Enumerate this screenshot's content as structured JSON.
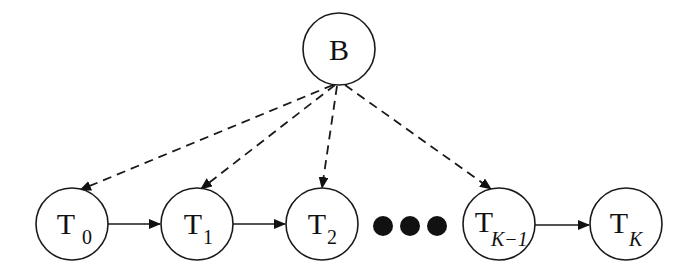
{
  "diagram": {
    "type": "graphical-model",
    "colors": {
      "stroke": "#1a1a1a",
      "fill": "#ffffff",
      "dots": "#111111"
    },
    "nodes": [
      {
        "id": "B",
        "label": "B",
        "sub": "",
        "cx": 339,
        "cy": 49
      },
      {
        "id": "T0",
        "label": "T",
        "sub": "0",
        "cx": 72,
        "cy": 224
      },
      {
        "id": "T1",
        "label": "T",
        "sub": "1",
        "cx": 197,
        "cy": 224
      },
      {
        "id": "T2",
        "label": "T",
        "sub": "2",
        "cx": 322,
        "cy": 224
      },
      {
        "id": "TK-1",
        "label": "T",
        "sub": "K−1",
        "cx": 499,
        "cy": 224
      },
      {
        "id": "TK",
        "label": "T",
        "sub": "K",
        "cx": 626,
        "cy": 224
      }
    ],
    "ellipsis": {
      "description": "three filled dots",
      "count": 3
    },
    "edges": [
      {
        "from": "B",
        "to": "T0",
        "style": "dashed"
      },
      {
        "from": "B",
        "to": "T1",
        "style": "dashed"
      },
      {
        "from": "B",
        "to": "T2",
        "style": "dashed"
      },
      {
        "from": "B",
        "to": "TK-1",
        "style": "dashed"
      },
      {
        "from": "T0",
        "to": "T1",
        "style": "solid"
      },
      {
        "from": "T1",
        "to": "T2",
        "style": "solid"
      },
      {
        "from": "TK-1",
        "to": "TK",
        "style": "solid"
      }
    ]
  }
}
